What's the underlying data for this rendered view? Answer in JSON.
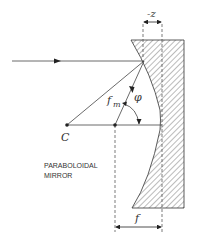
{
  "diagram": {
    "labels": {
      "center": "C",
      "focal_length_m": "f",
      "focal_length_m_sub": "m",
      "angle": "φ",
      "displacement": "-z",
      "focal_length": "f",
      "mirror_line1": "PARABOLOIDAL",
      "mirror_line2": "MIRROR"
    },
    "colors": {
      "line": "#333333",
      "hatch": "#555555",
      "background": "#ffffff"
    }
  }
}
